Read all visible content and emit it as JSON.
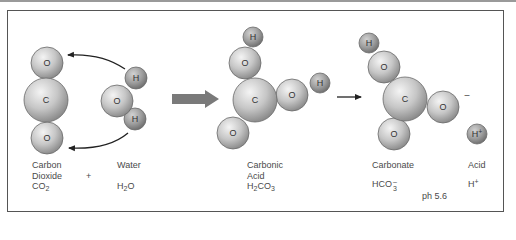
{
  "diagram": {
    "colors": {
      "frame": "#555555",
      "top_rule": "#9a9a9a",
      "atom_light": "#f2f2f2",
      "atom_mid": "#c4c4c4",
      "atom_dark": "#8c8c8c",
      "hydrogen_light": "#d6d6d6",
      "hydrogen_dark": "#7e7e7e",
      "big_arrow": "#7a7a7a",
      "arrow_line": "#222222",
      "text": "#4a4a4a"
    },
    "molecules": [
      {
        "id": "co2",
        "atoms": [
          {
            "symbol": "O",
            "cx": 47,
            "cy": 63,
            "r": 16,
            "type": "heavy"
          },
          {
            "symbol": "O",
            "cx": 47,
            "cy": 138,
            "r": 16,
            "type": "heavy"
          },
          {
            "symbol": "C",
            "cx": 46,
            "cy": 100,
            "r": 22,
            "type": "heavy"
          }
        ]
      },
      {
        "id": "h2o",
        "atoms": [
          {
            "symbol": "H",
            "cx": 136,
            "cy": 78,
            "r": 11,
            "type": "hydrogen"
          },
          {
            "symbol": "H",
            "cx": 135,
            "cy": 119,
            "r": 11,
            "type": "hydrogen"
          },
          {
            "symbol": "O",
            "cx": 117,
            "cy": 101,
            "r": 16,
            "type": "heavy"
          }
        ]
      },
      {
        "id": "h2co3",
        "atoms": [
          {
            "symbol": "H",
            "cx": 253,
            "cy": 37,
            "r": 10,
            "type": "hydrogen"
          },
          {
            "symbol": "H",
            "cx": 320,
            "cy": 83,
            "r": 10,
            "type": "hydrogen"
          },
          {
            "symbol": "O",
            "cx": 245,
            "cy": 63,
            "r": 16,
            "type": "heavy"
          },
          {
            "symbol": "O",
            "cx": 292,
            "cy": 95,
            "r": 16,
            "type": "heavy"
          },
          {
            "symbol": "O",
            "cx": 233,
            "cy": 133,
            "r": 16,
            "type": "heavy"
          },
          {
            "symbol": "C",
            "cx": 255,
            "cy": 100,
            "r": 22,
            "type": "heavy"
          }
        ]
      },
      {
        "id": "hco3",
        "atoms": [
          {
            "symbol": "H",
            "cx": 369,
            "cy": 43,
            "r": 10,
            "type": "hydrogen"
          },
          {
            "symbol": "O",
            "cx": 384,
            "cy": 67,
            "r": 16,
            "type": "heavy"
          },
          {
            "symbol": "O",
            "cx": 443,
            "cy": 107,
            "r": 16,
            "type": "heavy"
          },
          {
            "symbol": "O",
            "cx": 394,
            "cy": 134,
            "r": 16,
            "type": "heavy"
          },
          {
            "symbol": "C",
            "cx": 405,
            "cy": 99,
            "r": 22,
            "type": "heavy"
          }
        ]
      },
      {
        "id": "h_plus",
        "atoms": [
          {
            "symbol": "H+",
            "cx": 477,
            "cy": 134,
            "r": 10,
            "type": "hydrogen"
          }
        ]
      }
    ],
    "charge_minus": {
      "text": "–",
      "x": 467,
      "y": 98
    },
    "captions": {
      "co2": {
        "line1": "Carbon",
        "line2": "Dioxide",
        "formula_main": "CO",
        "formula_sub": "2"
      },
      "plus": "+",
      "h2o": {
        "line1": "Water",
        "formula_pre": "H",
        "formula_sub": "2",
        "formula_post": "O"
      },
      "h2co3": {
        "line1": "Carbonic",
        "line2": "Acid",
        "formula_pre": "H",
        "formula_sub1": "2",
        "formula_mid": "CO",
        "formula_sub2": "3"
      },
      "hco3": {
        "line1": "Carbonate",
        "formula_main": "HCO",
        "formula_sup": "–",
        "formula_sub": "3"
      },
      "acid": {
        "line1": "Acid",
        "formula_main": "H",
        "formula_sup": "+"
      },
      "ph": "ph 5.6"
    }
  }
}
